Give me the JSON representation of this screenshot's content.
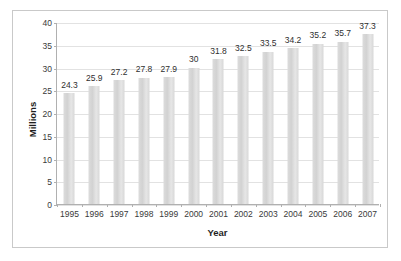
{
  "chart_data": {
    "type": "bar",
    "title": "",
    "xlabel": "Year",
    "ylabel": "Millions",
    "categories": [
      "1995",
      "1996",
      "1997",
      "1998",
      "1999",
      "2000",
      "2001",
      "2002",
      "2003",
      "2004",
      "2005",
      "2006",
      "2007"
    ],
    "values": [
      24.3,
      25.9,
      27.2,
      27.8,
      27.9,
      30,
      31.8,
      32.5,
      33.5,
      34.2,
      35.2,
      35.7,
      37.3
    ],
    "value_labels": [
      "24.3",
      "25.9",
      "27.2",
      "27.8",
      "27.9",
      "30",
      "31.8",
      "32.5",
      "33.5",
      "34.2",
      "35.2",
      "35.7",
      "37.3"
    ],
    "ylim": [
      0,
      40
    ],
    "yticks": [
      0,
      5,
      10,
      15,
      20,
      25,
      30,
      35,
      40
    ],
    "ytick_labels": [
      "0",
      "5",
      "10",
      "15",
      "20",
      "25",
      "30",
      "35",
      "40"
    ],
    "grid": true,
    "legend": false,
    "bar_color": "#d9d9d9",
    "gridline_color": "#e2e2e2",
    "axis_color": "#b0b0b0",
    "border_color": "#c9c9c9",
    "background_color": "#ffffff"
  }
}
